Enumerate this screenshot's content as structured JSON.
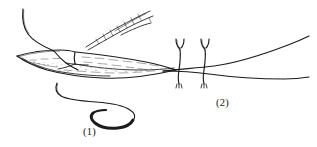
{
  "illustration": {
    "title": "Surgical suture technique line drawing",
    "background_color": "#ffffff",
    "ink_color": "#1d1b1a",
    "style": "pen-and-ink line art with stippled tissue shading"
  },
  "figures": [
    {
      "id": "fig1",
      "caption": "(1)",
      "caption_position": {
        "x": 83,
        "y": 126
      },
      "description": "Needle passed through an elevated tissue flap; curved needle and suture thread shown below",
      "parts": [
        {
          "name": "suture-thread-upper",
          "description": "curved thread descending from upper left into the wound"
        },
        {
          "name": "instrument-tip",
          "description": "hatched pointed needle holder entering from upper right"
        },
        {
          "name": "tissue-flap-upper",
          "description": "lifted tissue edge with outlined border"
        },
        {
          "name": "tissue-bed-stipple",
          "description": "stippled and dashed tissue bed shading"
        },
        {
          "name": "suture-thread-lower",
          "description": "long S-curved thread trailing below"
        },
        {
          "name": "curved-needle",
          "description": "heavy dark crescent curved surgical needle"
        }
      ]
    },
    {
      "id": "fig2",
      "caption": "(2)",
      "caption_position": {
        "x": 216,
        "y": 97
      },
      "description": "Two tied interrupted sutures in place across apposed wound edges",
      "knot_count": 2,
      "parts": [
        {
          "name": "suture-knot-left",
          "description": "tied suture with two free ends up and trimmed tails below"
        },
        {
          "name": "suture-knot-right",
          "description": "second tied suture with two free ends up and trimmed tails below"
        },
        {
          "name": "wound-edge-upper",
          "description": "upper tissue margin sweeping to the right"
        },
        {
          "name": "wound-edge-lower",
          "description": "lower tissue margin sweeping to the right"
        }
      ]
    }
  ]
}
